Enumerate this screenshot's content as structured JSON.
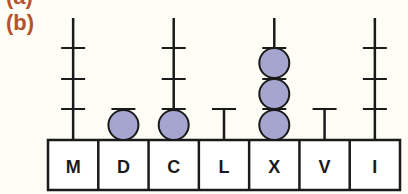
{
  "figure": {
    "partial_label_above": "(a)",
    "label": "(b)",
    "label_color": "#b5532b",
    "bead_color": "#a5a5cf",
    "line_color": "#1a1a1a"
  },
  "abacus": {
    "columns": [
      {
        "symbol": "M",
        "rod": "tall",
        "beads": 0
      },
      {
        "symbol": "D",
        "rod": "short",
        "beads": 1
      },
      {
        "symbol": "C",
        "rod": "tall",
        "beads": 1
      },
      {
        "symbol": "L",
        "rod": "short",
        "beads": 0
      },
      {
        "symbol": "X",
        "rod": "tall",
        "beads": 3
      },
      {
        "symbol": "V",
        "rod": "short",
        "beads": 0
      },
      {
        "symbol": "I",
        "rod": "tall",
        "beads": 0
      }
    ]
  }
}
